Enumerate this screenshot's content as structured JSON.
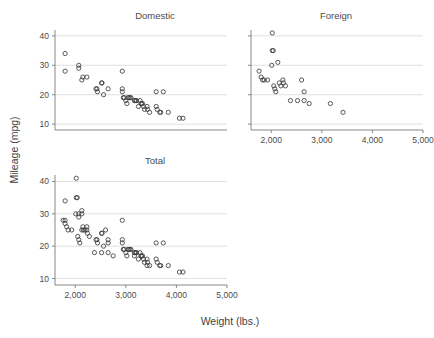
{
  "figure": {
    "xlabel": "Weight (lbs.)",
    "ylabel": "Mileage (mpg)",
    "background": "#ffffff",
    "marker_color": "#3c3c3c",
    "grid_color": "#d8d8d8",
    "axis_color": "#7a7a7a"
  },
  "chart_data": [
    {
      "type": "scatter",
      "title": "Domestic",
      "xlabel": "Weight (lbs.)",
      "ylabel": "Mileage (mpg)",
      "xlim": [
        1600,
        5000
      ],
      "ylim": [
        8,
        42
      ],
      "xticks": [],
      "xticklabels": [],
      "yticks": [
        10,
        20,
        30,
        40
      ],
      "yticklabels": [
        "10",
        "20",
        "30",
        "40"
      ],
      "grid": true,
      "grid_axis": "y",
      "legend": "none",
      "points": [
        {
          "x": 1800,
          "y": 28
        },
        {
          "x": 1800,
          "y": 34
        },
        {
          "x": 2070,
          "y": 29
        },
        {
          "x": 2070,
          "y": 30
        },
        {
          "x": 2130,
          "y": 25
        },
        {
          "x": 2150,
          "y": 26
        },
        {
          "x": 2230,
          "y": 26
        },
        {
          "x": 2410,
          "y": 22
        },
        {
          "x": 2430,
          "y": 22
        },
        {
          "x": 2440,
          "y": 21
        },
        {
          "x": 2520,
          "y": 24
        },
        {
          "x": 2530,
          "y": 24
        },
        {
          "x": 2560,
          "y": 20
        },
        {
          "x": 2650,
          "y": 22
        },
        {
          "x": 2930,
          "y": 28
        },
        {
          "x": 2930,
          "y": 22
        },
        {
          "x": 2930,
          "y": 21
        },
        {
          "x": 2950,
          "y": 19
        },
        {
          "x": 2970,
          "y": 19
        },
        {
          "x": 3000,
          "y": 18
        },
        {
          "x": 3020,
          "y": 17
        },
        {
          "x": 3040,
          "y": 19
        },
        {
          "x": 3060,
          "y": 19
        },
        {
          "x": 3080,
          "y": 19
        },
        {
          "x": 3100,
          "y": 19
        },
        {
          "x": 3170,
          "y": 18
        },
        {
          "x": 3180,
          "y": 18
        },
        {
          "x": 3200,
          "y": 18
        },
        {
          "x": 3210,
          "y": 18
        },
        {
          "x": 3250,
          "y": 16
        },
        {
          "x": 3280,
          "y": 18
        },
        {
          "x": 3300,
          "y": 17
        },
        {
          "x": 3310,
          "y": 17
        },
        {
          "x": 3330,
          "y": 17
        },
        {
          "x": 3350,
          "y": 16
        },
        {
          "x": 3370,
          "y": 15
        },
        {
          "x": 3420,
          "y": 16
        },
        {
          "x": 3430,
          "y": 15
        },
        {
          "x": 3470,
          "y": 14
        },
        {
          "x": 3600,
          "y": 21
        },
        {
          "x": 3600,
          "y": 16
        },
        {
          "x": 3620,
          "y": 15
        },
        {
          "x": 3670,
          "y": 14
        },
        {
          "x": 3690,
          "y": 14
        },
        {
          "x": 3740,
          "y": 21
        },
        {
          "x": 3840,
          "y": 14
        },
        {
          "x": 4060,
          "y": 12
        },
        {
          "x": 4130,
          "y": 12
        }
      ]
    },
    {
      "type": "scatter",
      "title": "Foreign",
      "xlabel": "Weight (lbs.)",
      "ylabel": "Mileage (mpg)",
      "xlim": [
        1600,
        5000
      ],
      "ylim": [
        8,
        42
      ],
      "xticks": [
        2000,
        3000,
        4000,
        5000
      ],
      "xticklabels": [
        "2,000",
        "3,000",
        "4,000",
        "5,000"
      ],
      "yticks": [
        10,
        20,
        30,
        40
      ],
      "yticklabels": [],
      "grid": true,
      "grid_axis": "y",
      "legend": "none",
      "points": [
        {
          "x": 2020,
          "y": 41
        },
        {
          "x": 2020,
          "y": 35
        },
        {
          "x": 2040,
          "y": 35
        },
        {
          "x": 2010,
          "y": 30
        },
        {
          "x": 2130,
          "y": 31
        },
        {
          "x": 1760,
          "y": 28
        },
        {
          "x": 1800,
          "y": 26
        },
        {
          "x": 1830,
          "y": 25
        },
        {
          "x": 1860,
          "y": 25
        },
        {
          "x": 1930,
          "y": 25
        },
        {
          "x": 2050,
          "y": 23
        },
        {
          "x": 2070,
          "y": 22
        },
        {
          "x": 2090,
          "y": 21
        },
        {
          "x": 2160,
          "y": 24
        },
        {
          "x": 2190,
          "y": 23
        },
        {
          "x": 2230,
          "y": 25
        },
        {
          "x": 2240,
          "y": 24
        },
        {
          "x": 2280,
          "y": 23
        },
        {
          "x": 2380,
          "y": 18
        },
        {
          "x": 2520,
          "y": 18
        },
        {
          "x": 2600,
          "y": 25
        },
        {
          "x": 2650,
          "y": 21
        },
        {
          "x": 2650,
          "y": 18
        },
        {
          "x": 2750,
          "y": 17
        },
        {
          "x": 3170,
          "y": 17
        },
        {
          "x": 3420,
          "y": 14
        }
      ]
    },
    {
      "type": "scatter",
      "title": "Total",
      "xlabel": "Weight (lbs.)",
      "ylabel": "Mileage (mpg)",
      "xlim": [
        1600,
        5000
      ],
      "ylim": [
        8,
        42
      ],
      "xticks": [
        2000,
        3000,
        4000,
        5000
      ],
      "xticklabels": [
        "2,000",
        "3,000",
        "4,000",
        "5,000"
      ],
      "yticks": [
        10,
        20,
        30,
        40
      ],
      "yticklabels": [
        "10",
        "20",
        "30",
        "40"
      ],
      "grid": true,
      "grid_axis": "y",
      "legend": "none",
      "points": [
        {
          "x": 2020,
          "y": 41
        },
        {
          "x": 1800,
          "y": 34
        },
        {
          "x": 2020,
          "y": 35
        },
        {
          "x": 2040,
          "y": 35
        },
        {
          "x": 2010,
          "y": 30
        },
        {
          "x": 2070,
          "y": 29
        },
        {
          "x": 2070,
          "y": 30
        },
        {
          "x": 2130,
          "y": 31
        },
        {
          "x": 2130,
          "y": 30
        },
        {
          "x": 1760,
          "y": 28
        },
        {
          "x": 1800,
          "y": 28
        },
        {
          "x": 1800,
          "y": 27
        },
        {
          "x": 1830,
          "y": 26
        },
        {
          "x": 1860,
          "y": 25
        },
        {
          "x": 1930,
          "y": 25
        },
        {
          "x": 2130,
          "y": 25
        },
        {
          "x": 2150,
          "y": 26
        },
        {
          "x": 2160,
          "y": 25
        },
        {
          "x": 2190,
          "y": 25
        },
        {
          "x": 2050,
          "y": 23
        },
        {
          "x": 2070,
          "y": 22
        },
        {
          "x": 2090,
          "y": 21
        },
        {
          "x": 2230,
          "y": 26
        },
        {
          "x": 2230,
          "y": 25
        },
        {
          "x": 2240,
          "y": 24
        },
        {
          "x": 2280,
          "y": 23
        },
        {
          "x": 2380,
          "y": 18
        },
        {
          "x": 2410,
          "y": 22
        },
        {
          "x": 2430,
          "y": 22
        },
        {
          "x": 2440,
          "y": 21
        },
        {
          "x": 2520,
          "y": 24
        },
        {
          "x": 2530,
          "y": 24
        },
        {
          "x": 2520,
          "y": 18
        },
        {
          "x": 2560,
          "y": 20
        },
        {
          "x": 2600,
          "y": 25
        },
        {
          "x": 2650,
          "y": 22
        },
        {
          "x": 2650,
          "y": 21
        },
        {
          "x": 2650,
          "y": 18
        },
        {
          "x": 2750,
          "y": 17
        },
        {
          "x": 2930,
          "y": 28
        },
        {
          "x": 2930,
          "y": 22
        },
        {
          "x": 2930,
          "y": 21
        },
        {
          "x": 2950,
          "y": 19
        },
        {
          "x": 2970,
          "y": 19
        },
        {
          "x": 3000,
          "y": 18
        },
        {
          "x": 3020,
          "y": 17
        },
        {
          "x": 3040,
          "y": 19
        },
        {
          "x": 3060,
          "y": 19
        },
        {
          "x": 3080,
          "y": 19
        },
        {
          "x": 3100,
          "y": 19
        },
        {
          "x": 3170,
          "y": 18
        },
        {
          "x": 3170,
          "y": 17
        },
        {
          "x": 3180,
          "y": 18
        },
        {
          "x": 3200,
          "y": 18
        },
        {
          "x": 3210,
          "y": 18
        },
        {
          "x": 3250,
          "y": 16
        },
        {
          "x": 3280,
          "y": 18
        },
        {
          "x": 3300,
          "y": 17
        },
        {
          "x": 3310,
          "y": 17
        },
        {
          "x": 3330,
          "y": 17
        },
        {
          "x": 3350,
          "y": 16
        },
        {
          "x": 3370,
          "y": 15
        },
        {
          "x": 3420,
          "y": 16
        },
        {
          "x": 3420,
          "y": 14
        },
        {
          "x": 3430,
          "y": 15
        },
        {
          "x": 3470,
          "y": 14
        },
        {
          "x": 3600,
          "y": 21
        },
        {
          "x": 3600,
          "y": 16
        },
        {
          "x": 3620,
          "y": 15
        },
        {
          "x": 3670,
          "y": 14
        },
        {
          "x": 3690,
          "y": 14
        },
        {
          "x": 3740,
          "y": 21
        },
        {
          "x": 3840,
          "y": 14
        },
        {
          "x": 4060,
          "y": 12
        },
        {
          "x": 4130,
          "y": 12
        }
      ]
    }
  ]
}
